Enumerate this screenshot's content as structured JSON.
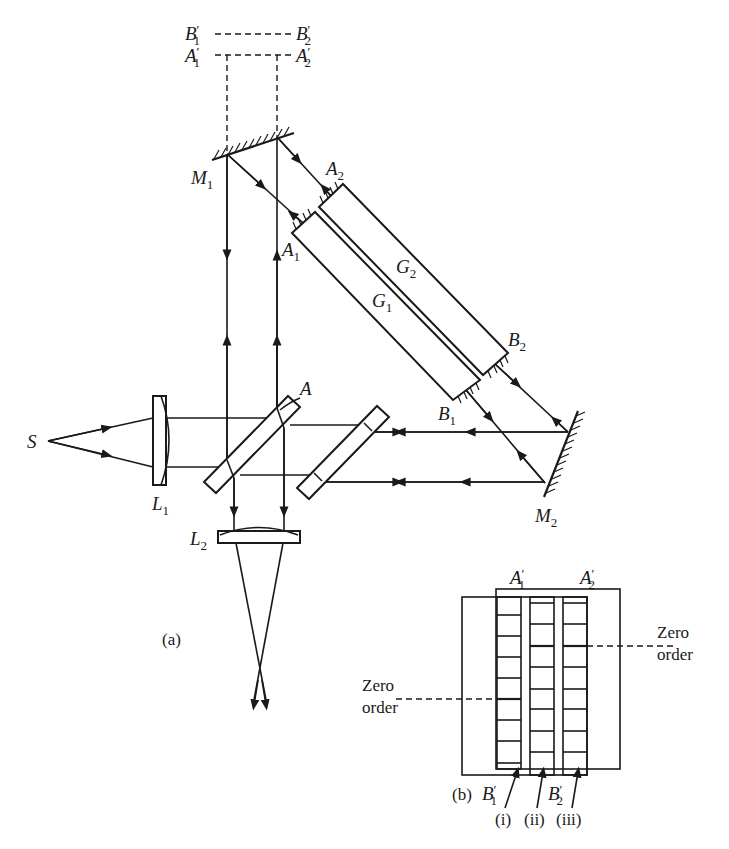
{
  "figure": {
    "panel_a": {
      "caption": "(a)",
      "labels": {
        "source": "S",
        "lens1": {
          "main": "L",
          "sub": "1"
        },
        "lens2": {
          "main": "L",
          "sub": "2"
        },
        "mirror1": {
          "main": "M",
          "sub": "1"
        },
        "mirror2": {
          "main": "M",
          "sub": "2"
        },
        "plate_point": "A",
        "g1": {
          "main": "G",
          "sub": "1"
        },
        "g2": {
          "main": "G",
          "sub": "2"
        },
        "a1": {
          "main": "A",
          "sub": "1"
        },
        "a2": {
          "main": "A",
          "sub": "2"
        },
        "b1": {
          "main": "B",
          "sub": "1"
        },
        "b2": {
          "main": "B",
          "sub": "2"
        },
        "b1p": {
          "main": "B",
          "sub": "1",
          "prime": "′"
        },
        "b2p": {
          "main": "B",
          "sub": "2",
          "prime": "′"
        },
        "a1p": {
          "main": "A",
          "sub": "1",
          "prime": "′"
        },
        "a2p": {
          "main": "A",
          "sub": "2",
          "prime": "′"
        }
      }
    },
    "panel_b": {
      "caption": "(b)",
      "zero_order_left": [
        "Zero",
        "order"
      ],
      "zero_order_right": [
        "Zero",
        "order"
      ],
      "column_labels": [
        "(i)",
        "(ii)",
        "(iii)"
      ],
      "top_labels": {
        "a1p": {
          "main": "A",
          "sub": "1",
          "prime": "′"
        },
        "a2p": {
          "main": "A",
          "sub": "2",
          "prime": "′"
        }
      },
      "bottom_labels": {
        "b1p": {
          "main": "B",
          "sub": "1",
          "prime": "′"
        },
        "b2p": {
          "main": "B",
          "sub": "2",
          "prime": "′"
        }
      }
    }
  }
}
